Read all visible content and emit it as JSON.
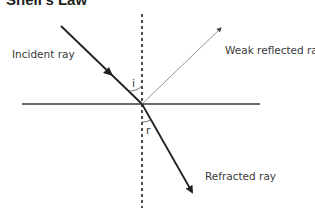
{
  "title": "Snell's Law",
  "labels": {
    "incident": "Incident ray",
    "reflected": "Weak reflected ray",
    "refracted": "Refracted ray",
    "angle_incidence": "i",
    "angle_refraction": "r"
  },
  "colors": {
    "ray": "#231f20",
    "reflected": "#6d6d6d",
    "text": "#3a3a3a"
  }
}
